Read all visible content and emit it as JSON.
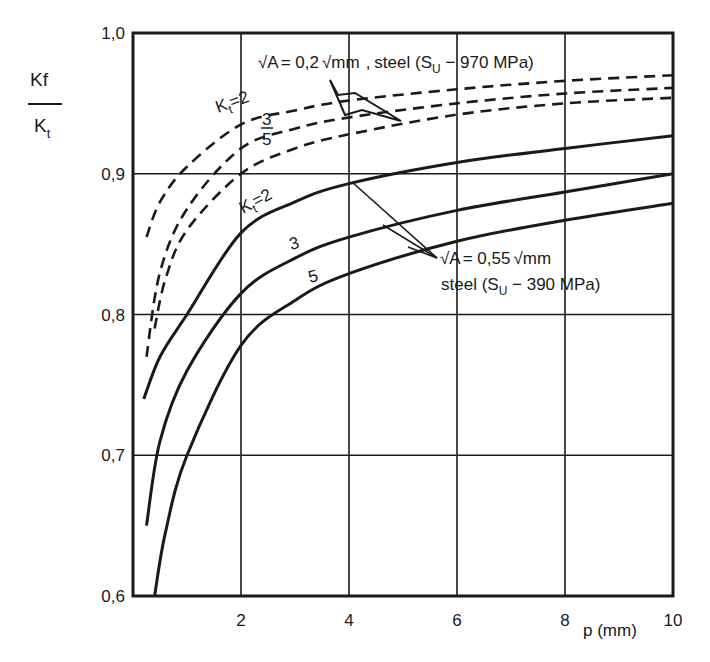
{
  "chart_data": {
    "type": "line",
    "title": "",
    "xlabel": "ρ (mm)",
    "ylabel_numerator": "Kf",
    "ylabel_denominator": "Kt",
    "ylabel": "Kf / Kt",
    "xlim": [
      0,
      10
    ],
    "ylim": [
      0.6,
      1.0
    ],
    "x_ticks": [
      2,
      4,
      6,
      8,
      10
    ],
    "x_tick_labels": [
      "2",
      "4",
      "6",
      "8",
      "10"
    ],
    "y_ticks": [
      0.6,
      0.7,
      0.8,
      0.9,
      1.0
    ],
    "y_tick_labels": [
      "0,6",
      "0,7",
      "0,8",
      "0,9",
      "1,0"
    ],
    "grid": true,
    "legend": "none (inline annotations)",
    "series": [
      {
        "name": "Kt=2, √A=0.2√mm, steel (Su=970 MPa)",
        "style": "dashed",
        "x": [
          0.25,
          0.5,
          1,
          2,
          3,
          4,
          6,
          8,
          10
        ],
        "y": [
          0.855,
          0.88,
          0.905,
          0.935,
          0.945,
          0.952,
          0.96,
          0.966,
          0.97
        ]
      },
      {
        "name": "Kt=3, √A=0.2√mm, steel (Su=970 MPa)",
        "style": "dashed",
        "x": [
          0.25,
          0.5,
          1,
          2,
          3,
          4,
          6,
          8,
          10
        ],
        "y": [
          0.77,
          0.83,
          0.875,
          0.918,
          0.932,
          0.94,
          0.95,
          0.957,
          0.961
        ]
      },
      {
        "name": "Kt=5, √A=0.2√mm, steel (Su=970 MPa)",
        "style": "dashed",
        "x": [
          0.4,
          0.6,
          1,
          2,
          3,
          4,
          6,
          8,
          10
        ],
        "y": [
          0.79,
          0.825,
          0.86,
          0.9,
          0.918,
          0.928,
          0.942,
          0.95,
          0.954
        ]
      },
      {
        "name": "Kt=2, √A=0.55√mm, steel (Su=390 MPa)",
        "style": "solid",
        "x": [
          0.2,
          0.5,
          1,
          2,
          3,
          4,
          6,
          8,
          10
        ],
        "y": [
          0.74,
          0.77,
          0.8,
          0.858,
          0.88,
          0.893,
          0.908,
          0.918,
          0.927
        ]
      },
      {
        "name": "Kt=3, √A=0.55√mm, steel (Su=390 MPa)",
        "style": "solid",
        "x": [
          0.25,
          0.5,
          1,
          2,
          3,
          4,
          6,
          8,
          10
        ],
        "y": [
          0.65,
          0.71,
          0.76,
          0.815,
          0.84,
          0.855,
          0.874,
          0.887,
          0.9
        ]
      },
      {
        "name": "Kt=5, √A=0.55√mm, steel (Su=390 MPa)",
        "style": "solid",
        "x": [
          0.4,
          0.6,
          1,
          2,
          3,
          4,
          6,
          8,
          10
        ],
        "y": [
          0.6,
          0.645,
          0.7,
          0.778,
          0.81,
          0.829,
          0.852,
          0.867,
          0.879
        ]
      }
    ],
    "annotations": [
      {
        "text": "√A = 0,2 √mm , steel (Su − 970 MPa)",
        "target": "dashed curves"
      },
      {
        "text": "√A = 0,55 √mm",
        "target": "solid curves"
      },
      {
        "text": "steel (Su − 390 MPa)",
        "target": "solid curves"
      },
      {
        "text": "Kt=2",
        "target": "dashed Kt=2 curve"
      },
      {
        "text": "3",
        "target": "dashed Kt=3 curve"
      },
      {
        "text": "5",
        "target": "dashed Kt=5 curve"
      },
      {
        "text": "Kt=2",
        "target": "solid Kt=2 curve"
      },
      {
        "text": "3",
        "target": "solid Kt=3 curve"
      },
      {
        "text": "5",
        "target": "solid Kt=5 curve"
      }
    ]
  },
  "labels": {
    "y_num": "Kf",
    "y_den": "K",
    "y_den_sub": "t",
    "x_axis": "p (mm)",
    "anno_top_sqrtA": "√A",
    "anno_top_eq": "= 0,2",
    "anno_top_sqrtmm": "√mm",
    "anno_top_steel": "steel (S",
    "anno_top_sub": "U",
    "anno_top_rest": " − 970 MPa)",
    "anno_bot_line1_a": "√A",
    "anno_bot_line1_b": "= 0,55",
    "anno_bot_line1_c": "√mm",
    "anno_bot_line2_a": "steel (S",
    "anno_bot_line2_sub": "U",
    "anno_bot_line2_b": " − 390 MPa)",
    "kt_dash_2": "K",
    "kt_dash_2_sub": "t",
    "kt_dash_2_eq": "=2",
    "kt_dash_3": "3",
    "kt_dash_5": "5",
    "kt_solid_2": "K",
    "kt_solid_2_sub": "t",
    "kt_solid_2_eq": "=2",
    "kt_solid_3": "3",
    "kt_solid_5": "5"
  },
  "colors": {
    "ink": "#1a1a1a",
    "background": "#ffffff"
  }
}
